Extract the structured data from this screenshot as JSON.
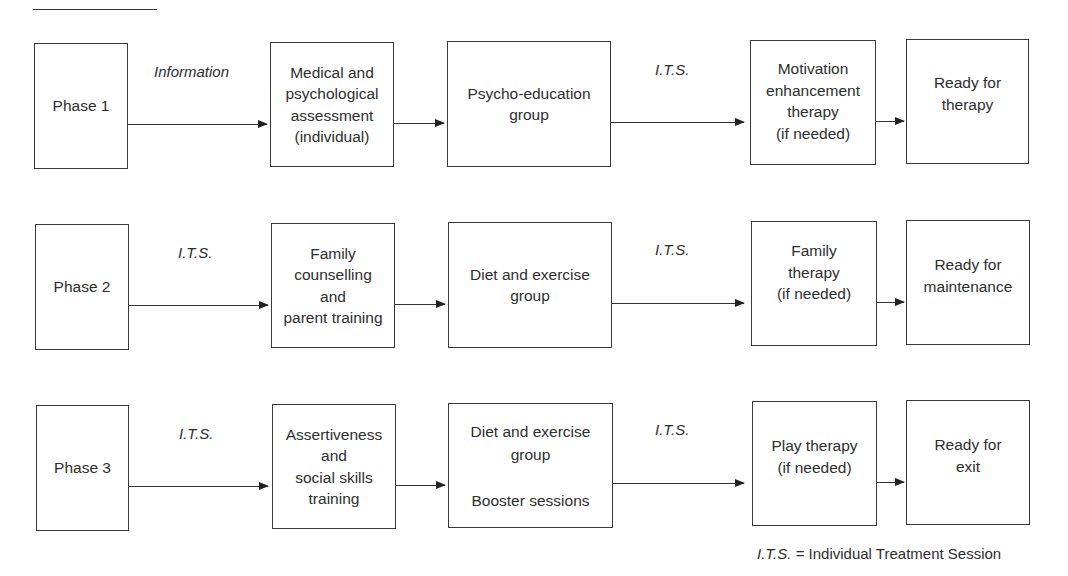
{
  "diagram": {
    "legend": {
      "abbr": "I.T.S.",
      "equals": "=",
      "meaning": "Individual Treatment Session"
    },
    "rows": [
      {
        "phase": "Phase 1",
        "label_1": "Information",
        "step_1": "Medical and\npsychological\nassessment\n(individual)",
        "step_2": "Psycho-education\ngroup",
        "label_2": "I.T.S.",
        "step_3": "Motivation\nenhancement\ntherapy\n(if needed)",
        "outcome": "Ready for\ntherapy"
      },
      {
        "phase": "Phase 2",
        "label_1": "I.T.S.",
        "step_1": "Family\ncounselling\nand\nparent training",
        "step_2": "Diet and exercise\ngroup",
        "label_2": "I.T.S.",
        "step_3": "Family\ntherapy\n(if needed)",
        "outcome": "Ready for\nmaintenance"
      },
      {
        "phase": "Phase 3",
        "label_1": "I.T.S.",
        "step_1": "Assertiveness\nand\nsocial skills\ntraining",
        "step_2": "Diet and exercise\ngroup\n\nBooster sessions",
        "label_2": "I.T.S.",
        "step_3": "Play therapy\n(if needed)",
        "outcome": "Ready for\nexit"
      }
    ]
  }
}
